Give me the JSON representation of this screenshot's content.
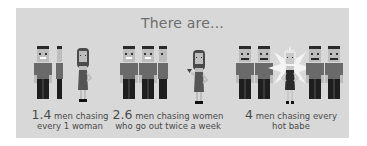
{
  "title": "There are...",
  "colors": {
    "card_background": "#d8d8d8",
    "title_text": "#6e6e6e",
    "caption_text": "#4a4a4a",
    "shirt": "#6a6a6a",
    "pants": "#1e1e1e",
    "dress": "#555555",
    "skin": "#bdbdbd"
  },
  "panels": [
    {
      "men_count": 1.4,
      "number": "1.4",
      "line1": " men chasing",
      "line2": "every 1 woman"
    },
    {
      "men_count": 2.6,
      "number": "2.6",
      "line1": " men chasing women",
      "line2": "who go out twice a week"
    },
    {
      "men_count": 4,
      "number": "4",
      "line1": " men chasing every",
      "line2": "hot babe"
    }
  ],
  "icons": {
    "man": "man-figure-icon",
    "woman": "woman-figure-icon",
    "hot_woman": "glowing-woman-figure-icon"
  }
}
